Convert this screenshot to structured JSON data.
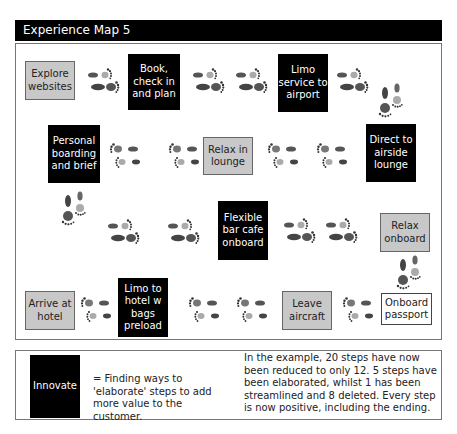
{
  "title": "Experience Map 5",
  "steps": [
    {
      "label": "Explore websites",
      "type": "keep"
    },
    {
      "label": "Book, check in and plan",
      "type": "innovate"
    },
    {
      "label": "Limo service to airport",
      "type": "innovate"
    },
    {
      "label": "Personal boarding and brief",
      "type": "innovate"
    },
    {
      "label": "Relax in lounge",
      "type": "keep"
    },
    {
      "label": "Direct to airside lounge",
      "type": "innovate"
    },
    {
      "label": "Flexible bar cafe onboard",
      "type": "innovate"
    },
    {
      "label": "Relax onboard",
      "type": "keep"
    },
    {
      "label": "Arrive at hotel",
      "type": "keep"
    },
    {
      "label": "Limo to hotel w bags preload",
      "type": "innovate"
    },
    {
      "label": "Leave aircraft",
      "type": "keep"
    },
    {
      "label": "Onboard passport",
      "type": "new"
    }
  ],
  "legend": {
    "swatch_label": "Innovate",
    "definition": "= Finding ways to 'elaborate' steps to add more value to the customer.",
    "summary": "In the example, 20 steps have now been reduced to only 12. 5 steps have been elaborated, whilst 1 has been streamlined and 8 deleted. Every step is now positive, including the ending."
  },
  "colors": {
    "innovate": "#000000",
    "keep": "#c8c8c8",
    "new": "#ffffff"
  },
  "icons": {
    "footprint": "footprints-icon"
  }
}
